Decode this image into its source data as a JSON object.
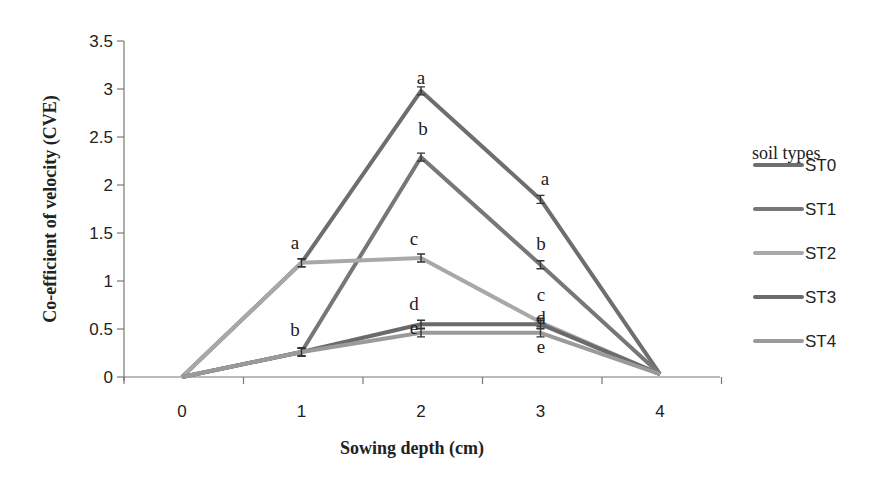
{
  "chart_data": {
    "type": "line",
    "title": "",
    "xlabel": "Sowing depth (cm)",
    "ylabel": "Co-efficient of velocity (CVE)",
    "x": [
      0,
      1,
      2,
      3,
      4
    ],
    "ylim": [
      0,
      3.5
    ],
    "yticks": [
      "0",
      "0.5",
      "1",
      "1.5",
      "2",
      "2.5",
      "3",
      "3.5"
    ],
    "xticks": [
      "0",
      "1",
      "2",
      "3",
      "4"
    ],
    "grid": false,
    "legend_title": "soil types",
    "legend_position": "right",
    "series": [
      {
        "name": "ST0",
        "color": "#6e6e6e",
        "values": [
          0,
          1.19,
          2.98,
          1.85,
          0.03
        ]
      },
      {
        "name": "ST1",
        "color": "#777777",
        "values": [
          0,
          0.26,
          2.29,
          1.17,
          0.03
        ]
      },
      {
        "name": "ST2",
        "color": "#a8a8a8",
        "values": [
          0,
          1.19,
          1.24,
          0.57,
          0.03
        ]
      },
      {
        "name": "ST3",
        "color": "#6a6a6a",
        "values": [
          0,
          0.26,
          0.55,
          0.55,
          0.03
        ]
      },
      {
        "name": "ST4",
        "color": "#9a9a9a",
        "values": [
          0,
          0.26,
          0.46,
          0.46,
          0.03
        ]
      }
    ],
    "annotations": [
      {
        "x": 1,
        "y": 1.19,
        "text": "a"
      },
      {
        "x": 1,
        "y": 0.26,
        "text": "b"
      },
      {
        "x": 2,
        "y": 2.98,
        "text": "a"
      },
      {
        "x": 2,
        "y": 2.29,
        "text": "b"
      },
      {
        "x": 2,
        "y": 1.24,
        "text": "c"
      },
      {
        "x": 2,
        "y": 0.55,
        "text": "d"
      },
      {
        "x": 2,
        "y": 0.46,
        "text": "e"
      },
      {
        "x": 3,
        "y": 1.85,
        "text": "a"
      },
      {
        "x": 3,
        "y": 1.17,
        "text": "b"
      },
      {
        "x": 3,
        "y": 0.57,
        "text": "c"
      },
      {
        "x": 3,
        "y": 0.55,
        "text": "d"
      },
      {
        "x": 3,
        "y": 0.46,
        "text": "e"
      }
    ]
  }
}
